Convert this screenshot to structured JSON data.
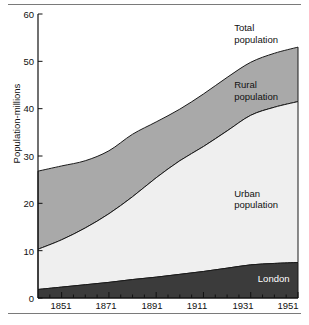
{
  "chart_data": {
    "type": "area",
    "title": "",
    "subtitle": "",
    "xlabel": "",
    "ylabel": "Population-millions",
    "xlim": [
      1841,
      1951
    ],
    "ylim": [
      0,
      60
    ],
    "grid": false,
    "legend_position": "inline-annotations",
    "stacked": true,
    "x": [
      1841,
      1851,
      1861,
      1871,
      1881,
      1891,
      1901,
      1911,
      1921,
      1931,
      1941,
      1951
    ],
    "xtick_labels": [
      "1851",
      "1871",
      "1891",
      "1911",
      "1931",
      "1951"
    ],
    "xtick_values": [
      1851,
      1871,
      1891,
      1911,
      1931,
      1951
    ],
    "ytick_labels": [
      "0",
      "10",
      "20",
      "30",
      "40",
      "50",
      "60"
    ],
    "ytick_values": [
      0,
      10,
      20,
      30,
      40,
      50,
      60
    ],
    "series": [
      {
        "name": "London",
        "color": "#3b3b3b",
        "values": [
          1.8,
          2.3,
          2.8,
          3.3,
          3.9,
          4.4,
          5.0,
          5.6,
          6.3,
          7.0,
          7.3,
          7.5
        ]
      },
      {
        "name": "Urban population",
        "color": "#efefef",
        "values": [
          8.5,
          10.0,
          12.0,
          14.5,
          17.5,
          21.0,
          24.0,
          26.4,
          29.0,
          31.6,
          33.0,
          34.0
        ]
      },
      {
        "name": "Rural population",
        "color": "#a9a9a9",
        "values": [
          16.5,
          15.6,
          14.2,
          13.3,
          13.2,
          11.8,
          10.9,
          11.1,
          11.3,
          11.2,
          11.4,
          11.5
        ]
      }
    ],
    "cumulative": {
      "london": [
        1.8,
        2.3,
        2.8,
        3.3,
        3.9,
        4.4,
        5.0,
        5.6,
        6.3,
        7.0,
        7.3,
        7.5
      ],
      "london_plus_urban": [
        10.3,
        12.3,
        14.8,
        17.8,
        21.4,
        25.4,
        29.0,
        32.0,
        35.3,
        38.6,
        40.3,
        41.5
      ],
      "total": [
        26.8,
        27.9,
        29.0,
        31.1,
        34.6,
        37.2,
        39.9,
        43.1,
        46.6,
        49.8,
        51.7,
        53.0
      ]
    },
    "annotations": [
      {
        "name": "total-population",
        "text": "Total\npopulation",
        "x": 1924,
        "y": 57
      },
      {
        "name": "rural-population",
        "text": "Rural\npopulation",
        "x": 1924,
        "y": 45
      },
      {
        "name": "urban-population",
        "text": "Urban\npopulation",
        "x": 1924,
        "y": 22
      },
      {
        "name": "london",
        "text": "London",
        "x": 1934,
        "y": 4
      }
    ]
  },
  "axes": {
    "y_label": "Population-millions",
    "y_ticks": [
      "60",
      "50",
      "40",
      "30",
      "20",
      "10",
      "0"
    ],
    "x_ticks": [
      "1851",
      "1871",
      "1891",
      "1911",
      "1931",
      "1951"
    ]
  },
  "labels": {
    "total": "Total\npopulation",
    "rural": "Rural\npopulation",
    "urban": "Urban\npopulation",
    "london": "London"
  }
}
